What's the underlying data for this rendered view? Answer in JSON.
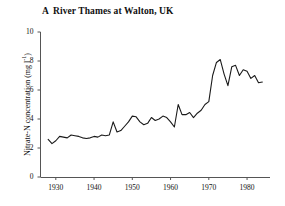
{
  "chart_data": {
    "type": "line",
    "panel_letter": "A",
    "title_text": "River Thames at Walton, UK",
    "xlabel": "",
    "ylabel": "Nitrate-N concentration (mg l-1)",
    "ylabel_main": "Nitrate-N concentration (mg l",
    "ylabel_sup": "-1",
    "ylabel_tail": ")",
    "xlim": [
      1926,
      1986
    ],
    "ylim": [
      0,
      10
    ],
    "grid": false,
    "legend": "none",
    "line_color": "#1a1a1a",
    "axis_color": "#555555",
    "background": "#ffffff",
    "x_ticks": [
      1930,
      1940,
      1950,
      1960,
      1970,
      1980
    ],
    "x_tick_labels": [
      "1930",
      "1940",
      "1950",
      "1960",
      "1970",
      "1980"
    ],
    "y_ticks": [
      0,
      2,
      4,
      6,
      8,
      10
    ],
    "y_tick_labels": [
      "0",
      "2",
      "4",
      "6",
      "8",
      "10"
    ],
    "series": [
      {
        "name": "Nitrate-N concentration",
        "x": [
          1928,
          1929,
          1930,
          1931,
          1932,
          1933,
          1934,
          1935,
          1936,
          1937,
          1938,
          1939,
          1940,
          1941,
          1942,
          1943,
          1944,
          1945,
          1946,
          1947,
          1948,
          1949,
          1950,
          1951,
          1952,
          1953,
          1954,
          1955,
          1956,
          1957,
          1958,
          1959,
          1960,
          1961,
          1962,
          1963,
          1964,
          1965,
          1966,
          1967,
          1968,
          1969,
          1970,
          1971,
          1972,
          1973,
          1974,
          1975,
          1976,
          1977,
          1978,
          1979,
          1980,
          1981,
          1982,
          1983,
          1984
        ],
        "values": [
          2.6,
          2.3,
          2.5,
          2.8,
          2.75,
          2.7,
          2.9,
          2.85,
          2.8,
          2.7,
          2.65,
          2.7,
          2.8,
          2.75,
          2.9,
          2.85,
          2.9,
          3.8,
          3.1,
          3.2,
          3.5,
          3.8,
          4.2,
          4.15,
          3.8,
          3.6,
          3.7,
          4.1,
          3.9,
          4.0,
          4.2,
          4.1,
          3.8,
          3.45,
          5.0,
          4.3,
          4.3,
          4.45,
          4.1,
          4.4,
          4.6,
          5.0,
          5.2,
          7.0,
          7.9,
          8.1,
          7.1,
          6.3,
          7.6,
          7.7,
          7.0,
          7.4,
          7.3,
          6.8,
          7.0,
          6.5,
          6.55
        ]
      }
    ]
  }
}
